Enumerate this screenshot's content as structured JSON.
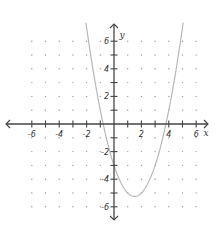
{
  "chart_data": {
    "type": "line",
    "title": "",
    "xlabel": "x",
    "ylabel": "y",
    "xlim": [
      -7,
      7
    ],
    "ylim": [
      -7,
      7
    ],
    "x_ticks": [
      -6,
      -5,
      -4,
      -3,
      -2,
      -1,
      1,
      2,
      3,
      4,
      5,
      6
    ],
    "x_tick_labels": [
      "-6",
      "-4",
      "-2",
      "2",
      "4",
      "6"
    ],
    "x_tick_label_values": [
      -6,
      -4,
      -2,
      2,
      4,
      6
    ],
    "y_ticks": [
      -6,
      -5,
      -4,
      -3,
      -2,
      -1,
      1,
      2,
      3,
      4,
      5,
      6
    ],
    "y_tick_labels": [
      "6",
      "4",
      "2",
      "-2",
      "-4",
      "-6"
    ],
    "y_tick_label_values": [
      6,
      4,
      2,
      -2,
      -4,
      -6
    ],
    "grid": "dots",
    "series": [
      {
        "name": "parabola",
        "equation": "y = x^2 - 3x - 3",
        "vertex": [
          1.5,
          -5.25
        ],
        "x_intercepts": [
          -0.79,
          3.79
        ],
        "y_intercept": -3,
        "x": [
          -2.05,
          -1.5,
          -1,
          -0.5,
          0,
          0.5,
          1,
          1.5,
          2,
          2.5,
          3,
          3.5,
          4,
          4.5,
          5.05
        ],
        "values": [
          7.35,
          4.75,
          1,
          -1.25,
          -3,
          -4.25,
          -5,
          -5.25,
          -5,
          -4.25,
          -3,
          -1.25,
          1,
          3.75,
          7.35
        ],
        "color": "#b8b8b8"
      }
    ]
  }
}
